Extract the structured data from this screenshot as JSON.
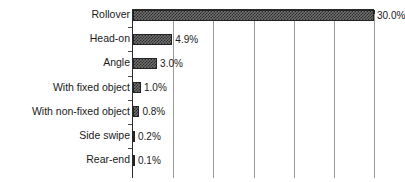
{
  "chart_data": {
    "type": "bar",
    "orientation": "horizontal",
    "title": "",
    "xlabel": "",
    "ylabel": "",
    "xlim": [
      0,
      30
    ],
    "grid": true,
    "gridlines": [
      5,
      10,
      15,
      20,
      25,
      30
    ],
    "legend": "none",
    "unit": "%",
    "categories": [
      "Rollover",
      "Head-on",
      "Angle",
      "With fixed object",
      "With non-fixed object",
      "Side swipe",
      "Rear-end"
    ],
    "values": [
      30.0,
      4.9,
      3.0,
      1.0,
      0.8,
      0.2,
      0.1
    ],
    "value_labels": [
      "30.0%",
      "4.9%",
      "3.0%",
      "1.0%",
      "0.8%",
      "0.2%",
      "0.1%"
    ]
  }
}
